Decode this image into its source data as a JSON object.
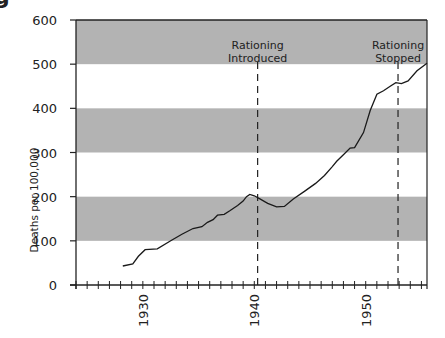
{
  "chart_data": {
    "type": "line",
    "title": "",
    "xlabel": "",
    "ylabel": "Deaths per 100,000",
    "xlim": [
      1924,
      1955.5
    ],
    "ylim": [
      0,
      600
    ],
    "yticks": [
      0,
      100,
      200,
      300,
      400,
      500,
      600
    ],
    "xtick_labels": [
      "1930",
      "1940",
      "1950"
    ],
    "x_minor_tick_step": 1,
    "bands": [
      {
        "from": 100,
        "to": 200,
        "color": "#b3b3b3"
      },
      {
        "from": 300,
        "to": 400,
        "color": "#b3b3b3"
      },
      {
        "from": 500,
        "to": 600,
        "color": "#b3b3b3"
      }
    ],
    "annotations": [
      {
        "x": 1940.3,
        "label_line1": "Rationing",
        "label_line2": "Introduced",
        "style": "dashed"
      },
      {
        "x": 1952.9,
        "label_line1": "Rationing",
        "label_line2": "Stopped",
        "style": "dashed"
      }
    ],
    "grid": false,
    "legend": null,
    "series": [
      {
        "name": "Deaths per 100,000",
        "color": "#1a1a1a",
        "x": [
          1928.2,
          1929.1,
          1929.6,
          1930.2,
          1931.3,
          1932.5,
          1933.5,
          1934.5,
          1935.3,
          1935.8,
          1936.3,
          1936.7,
          1937.3,
          1937.8,
          1938.5,
          1939.0,
          1939.3,
          1939.6,
          1940.0,
          1940.5,
          1941.2,
          1942.0,
          1942.7,
          1943.5,
          1944.5,
          1945.5,
          1946.3,
          1947.0,
          1947.4,
          1948.0,
          1948.6,
          1949.0,
          1949.8,
          1950.4,
          1951.0,
          1951.6,
          1952.2,
          1952.7,
          1953.2,
          1953.8,
          1954.6,
          1955.5
        ],
        "values": [
          43,
          48,
          65,
          80,
          82,
          100,
          115,
          128,
          132,
          142,
          148,
          158,
          160,
          168,
          180,
          190,
          200,
          205,
          202,
          195,
          185,
          177,
          178,
          195,
          212,
          230,
          248,
          268,
          280,
          295,
          310,
          311,
          345,
          395,
          432,
          440,
          450,
          458,
          456,
          462,
          485,
          502
        ]
      }
    ]
  },
  "page": {
    "title_fragment": "g",
    "yaxis_label": "Deaths per 100,000"
  }
}
